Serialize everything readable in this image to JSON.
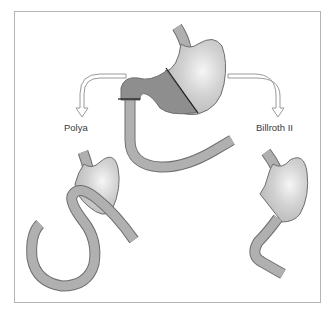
{
  "diagram": {
    "labels": {
      "left": "Polya",
      "right": "Billroth II"
    },
    "colors": {
      "frame": "#b4b4b4",
      "stomach_light": "#cfcfcf",
      "stomach_highlight": "#f4f4f4",
      "resected_dark": "#8e8e8e",
      "bowel": "#b0b0b0",
      "outline": "#6e6e6e",
      "cut_line": "#1a1a1a",
      "arrow_outline": "#9a9a9a"
    },
    "parts": [
      {
        "id": "top-stomach",
        "description": "Stomach with resection lines before surgery"
      },
      {
        "id": "polya",
        "description": "Polya gastrectomy reconstruction"
      },
      {
        "id": "billroth-ii",
        "description": "Billroth II reconstruction"
      }
    ]
  }
}
